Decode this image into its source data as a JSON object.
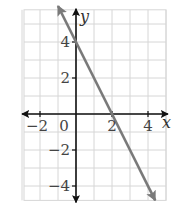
{
  "chart_data": {
    "type": "line",
    "title": "",
    "xlabel": "x",
    "ylabel": "y",
    "xlim": [
      -3,
      5
    ],
    "ylim": [
      -4.8,
      5.9
    ],
    "grid": true,
    "x_ticks": [
      -2,
      0,
      2,
      4
    ],
    "y_ticks": [
      4,
      2,
      -2,
      -4
    ],
    "x_tick_labels": [
      "−2",
      "0",
      "2",
      "4"
    ],
    "y_tick_labels": [
      "4",
      "2",
      "−2",
      "−4"
    ],
    "series": [
      {
        "name": "y = -2x + 4",
        "equation": "y = -2x + 4",
        "points": [
          [
            -1,
            6
          ],
          [
            0,
            4
          ],
          [
            2,
            0
          ],
          [
            4.4,
            -4.8
          ]
        ],
        "color": "#7a7a7a",
        "arrows": "both"
      }
    ],
    "intercepts": {
      "x": 2,
      "y": 4
    }
  },
  "colors": {
    "grid": "#d6d6d6",
    "axis": "#111111",
    "line": "#7a7a7a"
  }
}
